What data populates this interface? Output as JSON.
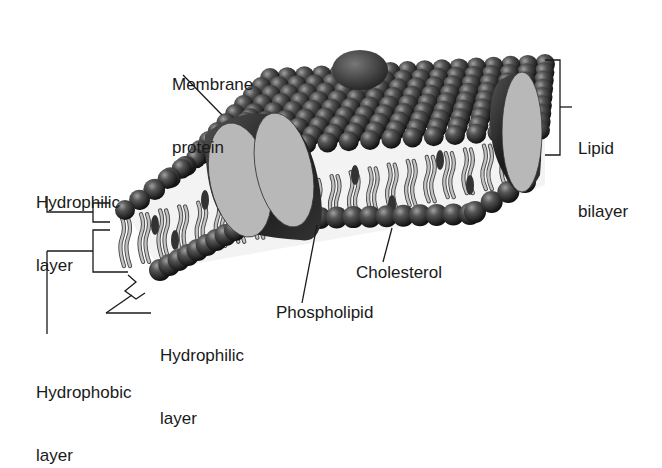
{
  "diagram": {
    "labels": {
      "membrane_protein": {
        "line1": "Membrane",
        "line2": "protein"
      },
      "lipid_bilayer": {
        "line1": "Lipid",
        "line2": "bilayer"
      },
      "hydrophilic_top": {
        "line1": "Hydrophilic",
        "line2": "layer"
      },
      "hydrophilic_bottom": {
        "line1": "Hydrophilic",
        "line2": "layer"
      },
      "hydrophobic": {
        "line1": "Hydrophobic",
        "line2": "layer"
      },
      "phospholipid": "Phospholipid",
      "cholesterol": "Cholesterol"
    },
    "colors": {
      "head_dark": "#1e1e1e",
      "head_light": "#8a8a8a",
      "tail": "#bdbdbd",
      "tail_outline": "#4a4a4a",
      "protein_face": "#b8b8b8",
      "protein_body": "#2a2a2a",
      "cholesterol": "#3a3a3a",
      "line": "#1a1a1a"
    }
  }
}
